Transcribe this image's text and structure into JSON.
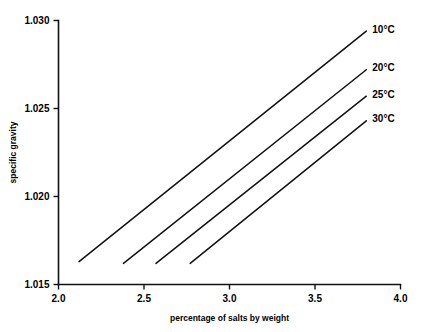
{
  "chart_data": {
    "type": "line",
    "title": "",
    "subtitle": "",
    "xlabel": "percentage of salts by weight",
    "ylabel": "specific gravity",
    "xlim": [
      2.0,
      4.0
    ],
    "ylim": [
      1.015,
      1.03
    ],
    "xticks": [
      "2.0",
      "2.5",
      "3.0",
      "3.5",
      "4.0"
    ],
    "xtick_values": [
      2.0,
      2.5,
      3.0,
      3.5,
      4.0
    ],
    "yticks": [
      "1.015",
      "1.020",
      "1.025",
      "1.030"
    ],
    "ytick_values": [
      1.015,
      1.02,
      1.025,
      1.03
    ],
    "grid": false,
    "legend_position": "inline-end-of-line",
    "line_color": "#111111",
    "background_color": "#ffffff",
    "series": [
      {
        "name": "10°C",
        "label": "10°C",
        "x": [
          2.12,
          3.8
        ],
        "y": [
          1.0163,
          1.0294
        ]
      },
      {
        "name": "20°C",
        "label": "20°C",
        "x": [
          2.38,
          3.8
        ],
        "y": [
          1.0162,
          1.0272
        ]
      },
      {
        "name": "25°C",
        "label": "25°C",
        "x": [
          2.57,
          3.8
        ],
        "y": [
          1.0162,
          1.0257
        ]
      },
      {
        "name": "30°C",
        "label": "30°C",
        "x": [
          2.77,
          3.8
        ],
        "y": [
          1.0162,
          1.0243
        ]
      }
    ]
  }
}
